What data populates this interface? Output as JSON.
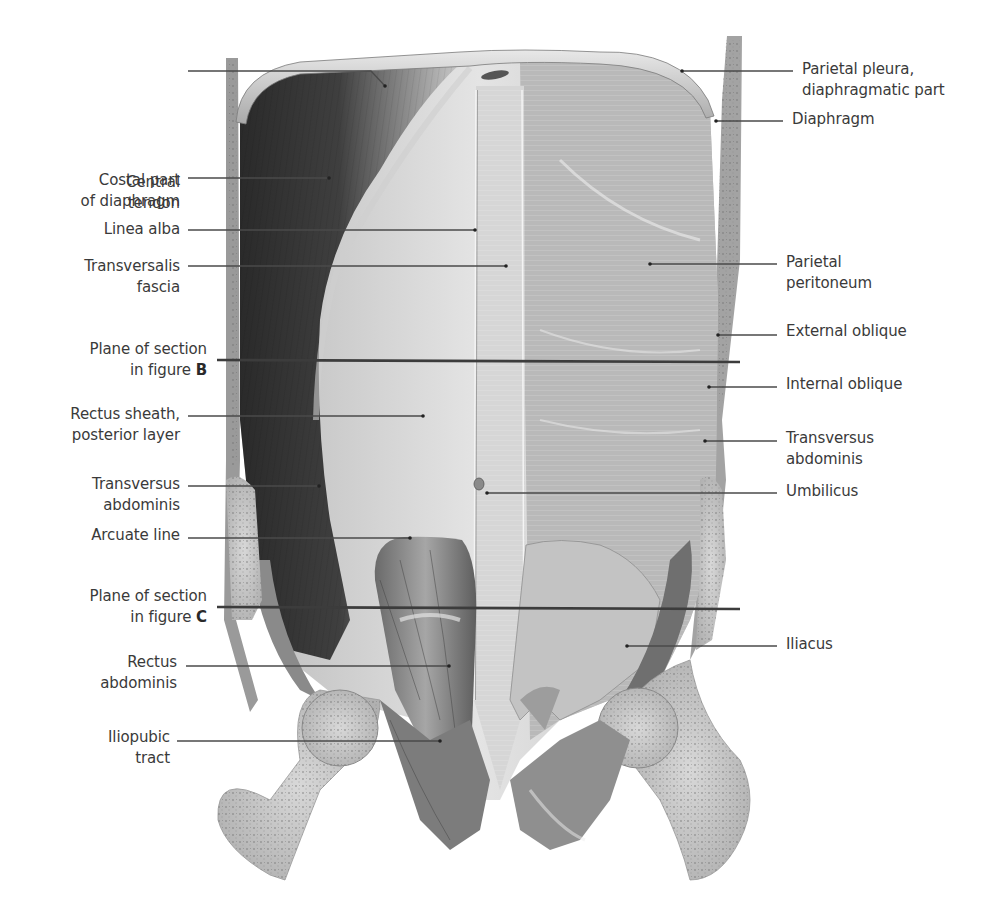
{
  "figure": {
    "ink_color": "#3a3a3a",
    "leader_color": "#4a4a4a",
    "section_line_color": "#3c3c3c"
  },
  "labels_left": [
    {
      "id": "central-tendon",
      "lines": [
        "Central",
        "tendon"
      ],
      "text_right": 180,
      "top": 172,
      "leader": [
        [
          188,
          71
        ],
        [
          371,
          71
        ],
        [
          385,
          86
        ]
      ]
    },
    {
      "id": "costal-part-of-diaphragm",
      "lines": [
        "Costal part",
        "of diaphragm"
      ],
      "text_right": 180,
      "top": 170,
      "leader": [
        [
          188,
          178
        ],
        [
          329,
          178
        ]
      ]
    },
    {
      "id": "linea-alba",
      "lines": [
        "Linea alba"
      ],
      "text_right": 180,
      "top": 219,
      "leader": [
        [
          188,
          230
        ],
        [
          475,
          230
        ]
      ]
    },
    {
      "id": "transversalis-fascia",
      "lines": [
        "Transversalis",
        "fascia"
      ],
      "text_right": 180,
      "top": 256,
      "leader": [
        [
          188,
          266
        ],
        [
          506,
          266
        ]
      ]
    },
    {
      "id": "plane-of-section-b",
      "lines": [
        "Plane of section",
        "in figure "
      ],
      "bold_suffix": "B",
      "text_right": 207,
      "top": 339,
      "leader": [
        [
          217,
          360
        ],
        [
          740,
          362
        ]
      ],
      "is_section_line": true
    },
    {
      "id": "rectus-sheath-posterior-layer",
      "lines": [
        "Rectus sheath,",
        "posterior layer"
      ],
      "text_right": 180,
      "top": 404,
      "leader": [
        [
          188,
          416
        ],
        [
          423,
          416
        ]
      ]
    },
    {
      "id": "transversus-abdominis-left",
      "lines": [
        "Transversus",
        "abdominis"
      ],
      "text_right": 180,
      "top": 474,
      "leader": [
        [
          188,
          486
        ],
        [
          319,
          486
        ]
      ]
    },
    {
      "id": "arcuate-line",
      "lines": [
        "Arcuate line"
      ],
      "text_right": 180,
      "top": 525,
      "leader": [
        [
          188,
          538
        ],
        [
          410,
          538
        ]
      ]
    },
    {
      "id": "plane-of-section-c",
      "lines": [
        "Plane of section",
        "in figure "
      ],
      "bold_suffix": "C",
      "text_right": 207,
      "top": 586,
      "leader": [
        [
          217,
          607
        ],
        [
          740,
          609
        ]
      ],
      "is_section_line": true
    },
    {
      "id": "rectus-abdominis",
      "lines": [
        "Rectus",
        "abdominis"
      ],
      "text_right": 177,
      "top": 652,
      "leader": [
        [
          186,
          666
        ],
        [
          449,
          666
        ]
      ]
    },
    {
      "id": "iliopubic-tract",
      "lines": [
        "Iliopubic",
        "tract"
      ],
      "text_right": 170,
      "top": 727,
      "leader": [
        [
          177,
          741
        ],
        [
          440,
          741
        ]
      ]
    }
  ],
  "labels_right": [
    {
      "id": "parietal-pleura-diaphragmatic-part",
      "lines": [
        "Parietal pleura,",
        "diaphragmatic part"
      ],
      "text_left": 802,
      "top": 59,
      "leader": [
        [
          793,
          71
        ],
        [
          682,
          71
        ]
      ]
    },
    {
      "id": "diaphragm",
      "lines": [
        "Diaphragm"
      ],
      "text_left": 792,
      "top": 109,
      "leader": [
        [
          783,
          121
        ],
        [
          716,
          121
        ]
      ]
    },
    {
      "id": "parietal-peritoneum",
      "lines": [
        "Parietal",
        "peritoneum"
      ],
      "text_left": 786,
      "top": 252,
      "leader": [
        [
          777,
          264
        ],
        [
          650,
          264
        ]
      ]
    },
    {
      "id": "external-oblique",
      "lines": [
        "External oblique"
      ],
      "text_left": 786,
      "top": 321,
      "leader": [
        [
          777,
          335
        ],
        [
          718,
          335
        ]
      ]
    },
    {
      "id": "internal-oblique",
      "lines": [
        "Internal oblique"
      ],
      "text_left": 786,
      "top": 374,
      "leader": [
        [
          777,
          387
        ],
        [
          709,
          387
        ]
      ]
    },
    {
      "id": "transversus-abdominis-right",
      "lines": [
        "Transversus",
        "abdominis"
      ],
      "text_left": 786,
      "top": 428,
      "leader": [
        [
          777,
          441
        ],
        [
          705,
          441
        ]
      ]
    },
    {
      "id": "umbilicus",
      "lines": [
        "Umbilicus"
      ],
      "text_left": 786,
      "top": 481,
      "leader": [
        [
          777,
          493
        ],
        [
          487,
          493
        ]
      ]
    },
    {
      "id": "iliacus",
      "lines": [
        "Iliacus"
      ],
      "text_left": 786,
      "top": 634,
      "leader": [
        [
          777,
          646
        ],
        [
          627,
          646
        ]
      ]
    }
  ]
}
